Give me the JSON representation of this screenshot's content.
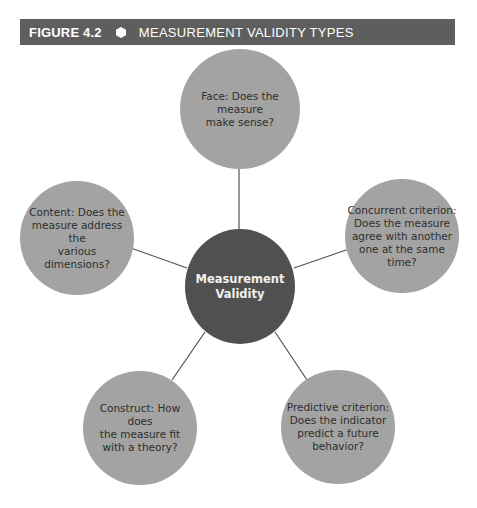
{
  "header": {
    "figure_number": "FIGURE 4.2",
    "bullet_icon": "hexagon-icon",
    "title": "MEASUREMENT VALIDITY TYPES"
  },
  "colors": {
    "header_bg": "#5e5e5e",
    "outer_node": "#a3a3a3",
    "center_node": "#505050",
    "connector": "#555555"
  },
  "diagram": {
    "center": {
      "label": "Measurement\nValidity"
    },
    "nodes": [
      {
        "id": "face",
        "label": "Face: Does the\nmeasure\nmake sense?"
      },
      {
        "id": "content",
        "label": "Content: Does the\nmeasure address the\nvarious dimensions?"
      },
      {
        "id": "concurrent",
        "label": "Concurrent criterion:\nDoes the measure\nagree with another\none at the same\ntime?"
      },
      {
        "id": "construct",
        "label": "Construct: How does\nthe measure fit\nwith a theory?"
      },
      {
        "id": "predictive",
        "label": "Predictive criterion:\nDoes the indicator\npredict a future\nbehavior?"
      }
    ]
  }
}
